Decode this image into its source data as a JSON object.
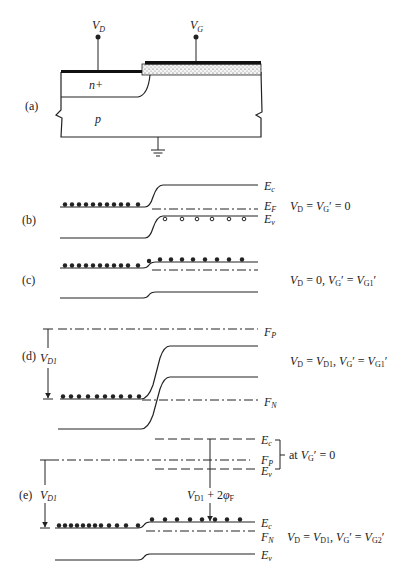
{
  "figure": {
    "panels": [
      {
        "id": "a",
        "label": "(a)",
        "terminals": {
          "drain": "V",
          "drain_sub": "D",
          "gate": "V",
          "gate_sub": "G"
        },
        "regions": {
          "n_plus": "n+",
          "substrate": "p"
        }
      },
      {
        "id": "b",
        "label": "(b)",
        "levels": {
          "ec": "E",
          "ec_sub": "c",
          "ef": "E",
          "ef_sub": "F",
          "ev": "E",
          "ev_sub": "v"
        },
        "condition": {
          "v1": "V",
          "s1": "D",
          "eq": " = ",
          "v2": "V",
          "s2": "G",
          "tail": "′ = 0"
        }
      },
      {
        "id": "c",
        "label": "(c)",
        "condition": {
          "v1": "V",
          "s1": "D",
          "mid": " = 0, ",
          "v2": "V",
          "s2": "G",
          "mid2": "′ = ",
          "v3": "V",
          "s3": "G1",
          "tail": "′"
        }
      },
      {
        "id": "d",
        "label": "(d)",
        "arrow": {
          "v": "V",
          "sub": "D1"
        },
        "levels": {
          "fp": "F",
          "fp_sub": "P",
          "fn": "F",
          "fn_sub": "N"
        },
        "condition": {
          "v1": "V",
          "s1": "D",
          "mid": " = ",
          "v2": "V",
          "s2": "D1",
          "mid2": ", ",
          "v3": "V",
          "s3": "G",
          "mid3": "′ = ",
          "v4": "V",
          "s4": "G1",
          "tail": "′"
        }
      },
      {
        "id": "e",
        "label": "(e)",
        "arrow": {
          "v": "V",
          "sub": "D1"
        },
        "inner_arrow": {
          "v": "V",
          "sub": "D1",
          "plus": " + 2",
          "phi": "φ",
          "phi_sub": "F"
        },
        "upper_levels": {
          "ec": "E",
          "ec_sub": "c",
          "fp": "F",
          "fp_sub": "P",
          "ev": "E",
          "ev_sub": "v"
        },
        "bracket_note": {
          "pre": "at ",
          "v": "V",
          "sub": "G",
          "tail": "′ = 0"
        },
        "lower_levels": {
          "ec": "E",
          "ec_sub": "c",
          "fn": "F",
          "fn_sub": "N",
          "ev": "E",
          "ev_sub": "v"
        },
        "condition": {
          "v1": "V",
          "s1": "D",
          "mid": " = ",
          "v2": "V",
          "s2": "D1",
          "mid2": ", ",
          "v3": "V",
          "s3": "G",
          "mid3": "′ = ",
          "v4": "V",
          "s4": "G2",
          "tail": "′"
        }
      }
    ]
  }
}
